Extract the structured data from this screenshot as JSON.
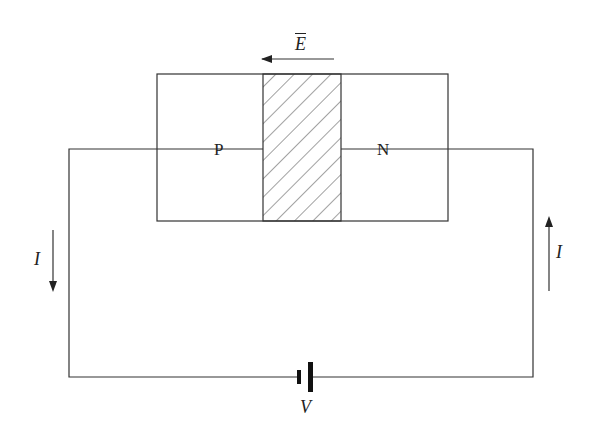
{
  "diagram": {
    "labels": {
      "p_region": "P",
      "n_region": "N",
      "field": "E",
      "current_left": "I",
      "current_right": "I",
      "voltage": "V"
    },
    "colors": {
      "line": "#333333",
      "background": "#ffffff"
    }
  }
}
